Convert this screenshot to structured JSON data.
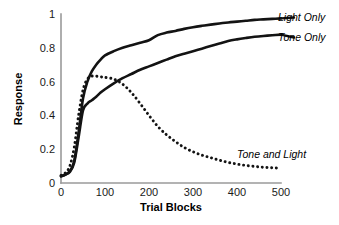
{
  "chart_data": {
    "type": "line",
    "title": "",
    "xlabel": "Trial Blocks",
    "ylabel": "Response",
    "xlim": [
      0,
      500
    ],
    "ylim": [
      0,
      1
    ],
    "grid": false,
    "legend_position": "inline-right-annotations",
    "xticks": [
      "0",
      "100",
      "200",
      "300",
      "400",
      "500"
    ],
    "xtick_values": [
      0,
      100,
      200,
      300,
      400,
      500
    ],
    "yticks": [
      "0",
      "0.2",
      "0.4",
      "0.6",
      "0.8",
      "1"
    ],
    "ytick_values": [
      0,
      0.2,
      0.4,
      0.6,
      0.8,
      1
    ],
    "x": [
      0,
      10,
      20,
      30,
      40,
      50,
      60,
      70,
      80,
      90,
      100,
      120,
      140,
      160,
      180,
      200,
      220,
      240,
      260,
      280,
      300,
      320,
      340,
      360,
      380,
      400,
      420,
      440,
      460,
      480,
      500
    ],
    "series": [
      {
        "name": "Light Only",
        "style": "solid",
        "color": "#131313",
        "values": [
          0.04,
          0.05,
          0.07,
          0.13,
          0.3,
          0.5,
          0.6,
          0.66,
          0.7,
          0.73,
          0.755,
          0.78,
          0.8,
          0.815,
          0.83,
          0.845,
          0.875,
          0.89,
          0.9,
          0.912,
          0.922,
          0.93,
          0.937,
          0.944,
          0.95,
          0.955,
          0.96,
          0.965,
          0.968,
          0.971,
          0.974
        ]
      },
      {
        "name": "Tone Only",
        "style": "solid",
        "color": "#131313",
        "values": [
          0.04,
          0.05,
          0.065,
          0.12,
          0.27,
          0.43,
          0.47,
          0.49,
          0.51,
          0.535,
          0.555,
          0.59,
          0.62,
          0.645,
          0.67,
          0.69,
          0.71,
          0.73,
          0.75,
          0.765,
          0.78,
          0.795,
          0.81,
          0.825,
          0.84,
          0.85,
          0.858,
          0.865,
          0.87,
          0.874,
          0.878
        ]
      },
      {
        "name": "Tone and Light",
        "style": "dotted",
        "color": "#131313",
        "values": [
          0.045,
          0.06,
          0.1,
          0.21,
          0.4,
          0.55,
          0.615,
          0.632,
          0.632,
          0.628,
          0.625,
          0.615,
          0.585,
          0.535,
          0.47,
          0.4,
          0.335,
          0.285,
          0.245,
          0.21,
          0.185,
          0.165,
          0.15,
          0.135,
          0.122,
          0.112,
          0.104,
          0.098,
          0.093,
          0.09,
          0.088
        ]
      }
    ],
    "annotations": [
      {
        "text": "Light Only",
        "series": "Light Only"
      },
      {
        "text": "Tone Only",
        "series": "Tone Only"
      },
      {
        "text": "Tone and Light",
        "series": "Tone and Light"
      }
    ]
  },
  "colors": {
    "axis": "#9a9a9a",
    "curve": "#131313",
    "background": "#ffffff"
  }
}
